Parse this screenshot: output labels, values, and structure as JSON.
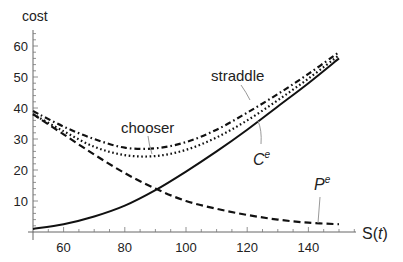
{
  "chart_data": {
    "type": "line",
    "title": "",
    "xlabel": "S(t)",
    "ylabel": "cost",
    "xlim": [
      50,
      155
    ],
    "ylim": [
      0,
      65
    ],
    "xticks": [
      60,
      80,
      100,
      120,
      140
    ],
    "yticks": [
      10,
      20,
      30,
      40,
      50,
      60
    ],
    "grid": false,
    "legend": "inline annotations",
    "x": [
      50,
      60,
      70,
      80,
      90,
      100,
      110,
      120,
      130,
      140,
      150
    ],
    "series": [
      {
        "name": "straddle",
        "style": "dash-dot",
        "values": [
          39,
          34,
          30,
          27.2,
          27,
          29,
          33,
          38.5,
          44.5,
          51,
          58
        ]
      },
      {
        "name": "chooser",
        "style": "dotted",
        "values": [
          38,
          32.5,
          27.5,
          24.8,
          24.5,
          26.5,
          30.5,
          36,
          42.5,
          49.5,
          57
        ]
      },
      {
        "name": "C^e",
        "style": "solid",
        "values": [
          1,
          2.5,
          5,
          8.5,
          13.5,
          19.5,
          26,
          33,
          40.5,
          48,
          56
        ]
      },
      {
        "name": "P^e",
        "style": "dashed",
        "values": [
          38,
          31.5,
          25,
          19,
          14,
          10,
          7.5,
          5.5,
          4,
          3,
          2.5
        ]
      }
    ],
    "annotations": [
      {
        "text": "straddle",
        "points_to": "straddle curve near S≈112"
      },
      {
        "text": "chooser",
        "points_to": "chooser curve near S≈86"
      },
      {
        "text": "C^e",
        "points_to": "C^e curve near S≈115"
      },
      {
        "text": "P^e",
        "points_to": "P^e curve near S≈143"
      }
    ]
  },
  "labels": {
    "ylabel": "cost",
    "xlabel_main": "S(",
    "xlabel_var": "t",
    "xlabel_close": ")",
    "straddle": "straddle",
    "chooser": "chooser",
    "ce_base": "C",
    "ce_sup": "e",
    "pe_base": "P",
    "pe_sup": "e"
  },
  "colors": {
    "line": "#111111",
    "axis": "#555555",
    "leader": "#999999"
  }
}
